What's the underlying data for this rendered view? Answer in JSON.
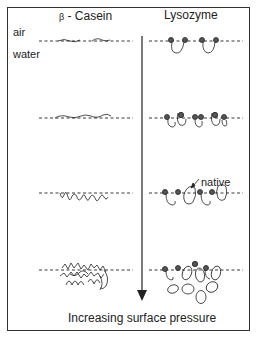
{
  "diagram": {
    "columns": [
      {
        "title_prefix": "β",
        "title_text": " - Casein"
      },
      {
        "title_text": "Lysozyme"
      }
    ],
    "phase_labels": {
      "top": "air",
      "bottom": "water"
    },
    "annotation": "native",
    "arrow_label": "Increasing surface pressure",
    "stages": [
      {
        "index": 1,
        "casein": "flat extended chains at interface",
        "lysozyme": "sparse adsorbed molecules with dangling loops"
      },
      {
        "index": 2,
        "casein": "denser flat chains",
        "lysozyme": "packed adsorbed molecules with loops"
      },
      {
        "index": 3,
        "casein": "loops and tails protruding into water",
        "lysozyme": "native molecules inserted between unfolded ones"
      },
      {
        "index": 4,
        "casein": "thick tangled layer in water",
        "lysozyme": "many native globules beneath interface"
      }
    ],
    "colors": {
      "ink": "#222222",
      "frame": "#333333",
      "background": "#ffffff"
    }
  }
}
